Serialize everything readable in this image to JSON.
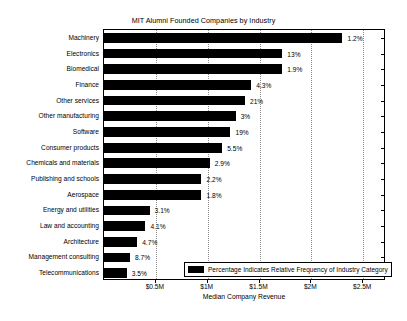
{
  "chart_data": {
    "type": "bar",
    "orientation": "horizontal",
    "title": "MIT Alumni Founded Companies by Industry",
    "xlabel": "Median Company Revenue",
    "ylabel": "",
    "xlim": [
      0,
      2.72
    ],
    "xtick_labels": [
      "$0.5M",
      "$1M",
      "$1.5M",
      "$2M",
      "$2.5M"
    ],
    "xtick_values": [
      0.5,
      1.0,
      1.5,
      2.0,
      2.5
    ],
    "grid": true,
    "legend_position": "lower right",
    "legend_entries": [
      "Percentage Indicates Relative Frequency of Industry Category"
    ],
    "bar_color": "#000000",
    "categories": [
      "Machinery",
      "Electronics",
      "Biomedical",
      "Finance",
      "Other services",
      "Other manufacturing",
      "Software",
      "Consumer products",
      "Chemicals and materials",
      "Publishing and schools",
      "Aerospace",
      "Energy and utilities",
      "Law and accounting",
      "Architecture",
      "Management consulting",
      "Telecommunications"
    ],
    "values": [
      2.3,
      1.72,
      1.72,
      1.42,
      1.36,
      1.27,
      1.22,
      1.14,
      1.02,
      0.94,
      0.94,
      0.44,
      0.4,
      0.32,
      0.25,
      0.22
    ],
    "data_labels": [
      "1.2%",
      "13%",
      "1.9%",
      "4.3%",
      "21%",
      "3%",
      "19%",
      "5.5%",
      "2.9%",
      "2.2%",
      "1.8%",
      "3.1%",
      "4.1%",
      "4.7%",
      "8.7%",
      "3.5%"
    ]
  },
  "legend": {
    "swatch_name": "bar-color-swatch",
    "text": "Percentage Indicates Relative Frequency of Industry Category"
  },
  "axes": {
    "x_title": "Median Company Revenue"
  }
}
